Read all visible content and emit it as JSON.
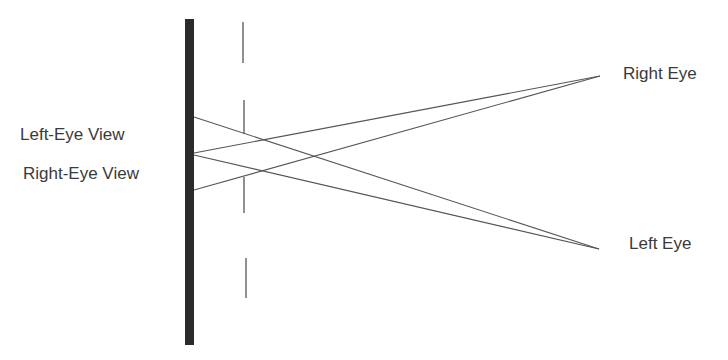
{
  "diagram": {
    "colors": {
      "background": "#ffffff",
      "display_bar": "#2b2b2b",
      "barrier": "#555555",
      "rays": "#555555",
      "text": "#3a3a3a"
    },
    "labels": {
      "left_eye_view": "Left-Eye View",
      "right_eye_view": "Right-Eye View",
      "right_eye": "Right Eye",
      "left_eye": "Left Eye"
    },
    "display_bar": {
      "x": 185,
      "y": 19,
      "width": 9,
      "height": 326
    },
    "barrier_segments": [
      {
        "x": 243,
        "y1": 22,
        "y2": 63
      },
      {
        "x": 244,
        "y1": 100,
        "y2": 134
      },
      {
        "x": 244,
        "y1": 177,
        "y2": 213
      },
      {
        "x": 246,
        "y1": 258,
        "y2": 298
      }
    ],
    "eyes": {
      "right_eye": {
        "x": 600,
        "y": 76
      },
      "left_eye": {
        "x": 599,
        "y": 249
      }
    },
    "rays": [
      {
        "from": [
          194,
          117
        ],
        "to": "left_eye"
      },
      {
        "from": [
          194,
          153
        ],
        "to": "right_eye"
      },
      {
        "from": [
          194,
          155
        ],
        "to": "left_eye"
      },
      {
        "from": [
          194,
          190
        ],
        "to": "right_eye"
      }
    ]
  }
}
